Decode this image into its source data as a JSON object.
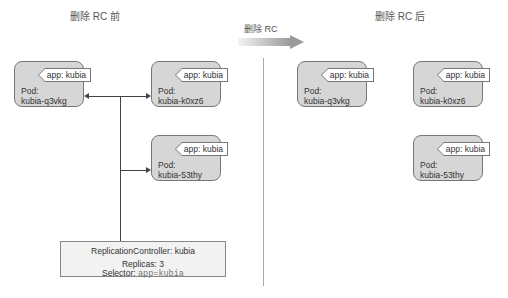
{
  "titles": {
    "before": "删除 RC 前",
    "after": "删除 RC 后",
    "transition": "删除 RC"
  },
  "before": {
    "pods": [
      {
        "kind": "Pod:",
        "name": "kubia-q3vkg",
        "label": "app: kubia"
      },
      {
        "kind": "Pod:",
        "name": "kubia-k0xz6",
        "label": "app: kubia"
      },
      {
        "kind": "Pod:",
        "name": "kubia-53thy",
        "label": "app: kubia"
      }
    ],
    "replication_controller": {
      "title": "ReplicationController: kubia",
      "replicas": "Replicas: 3",
      "selector_label": "Selector:",
      "selector_value": "app=kubia"
    }
  },
  "after": {
    "pods": [
      {
        "kind": "Pod:",
        "name": "kubia-q3vkg",
        "label": "app: kubia"
      },
      {
        "kind": "Pod:",
        "name": "kubia-k0xz6",
        "label": "app: kubia"
      },
      {
        "kind": "Pod:",
        "name": "kubia-53thy",
        "label": "app: kubia"
      }
    ]
  },
  "colors": {
    "pod_fill": "#d6d6d6",
    "rc_fill": "#f2f2f2",
    "arrow_gradient_start": "#f0f0f0",
    "arrow_gradient_end": "#999999"
  }
}
